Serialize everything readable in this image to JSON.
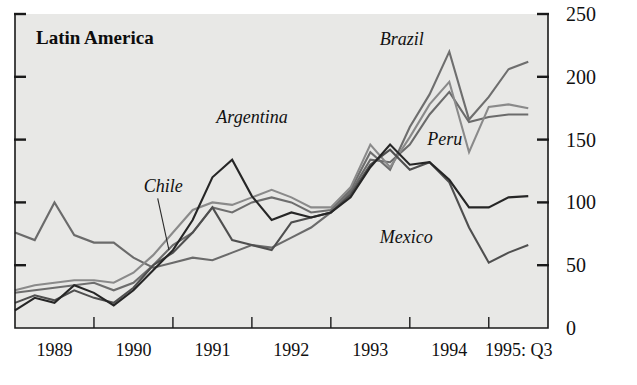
{
  "chart_data": {
    "type": "line",
    "title": "Latin America",
    "xlabel": "",
    "ylabel": "",
    "ylim": [
      0,
      250
    ],
    "yticks": [
      0,
      50,
      100,
      150,
      200,
      250
    ],
    "ytick_labels": [
      "0",
      "50",
      "100",
      "150",
      "200",
      "250"
    ],
    "grid": false,
    "legend_position": "inline-annotations",
    "xlim": [
      1989.0,
      1995.75
    ],
    "xtick_positions": [
      1989,
      1990,
      1991,
      1992,
      1993,
      1994,
      1995
    ],
    "xtick_labels": [
      "1989",
      "1990",
      "1991",
      "1992",
      "1993",
      "1994",
      "1995: Q3"
    ],
    "x_quarters": [
      1989.0,
      1989.25,
      1989.5,
      1989.75,
      1990.0,
      1990.25,
      1990.5,
      1990.75,
      1991.0,
      1991.25,
      1991.5,
      1991.75,
      1992.0,
      1992.25,
      1992.5,
      1992.75,
      1993.0,
      1993.25,
      1993.5,
      1993.75,
      1994.0,
      1994.25,
      1994.5,
      1994.75,
      1995.0,
      1995.25,
      1995.5
    ],
    "series": [
      {
        "name": "Argentina",
        "color": "#262626",
        "width": 2.3,
        "label_x": 1991.55,
        "label_y": 163,
        "values": [
          14,
          24,
          20,
          34,
          28,
          18,
          30,
          46,
          62,
          86,
          120,
          134,
          105,
          86,
          92,
          88,
          92,
          104,
          128,
          146,
          130,
          132,
          118,
          96,
          96,
          104,
          105
        ]
      },
      {
        "name": "Brazil",
        "color": "#6e6e6e",
        "width": 2.5,
        "label_x": 1993.62,
        "label_y": 225,
        "values": [
          28,
          30,
          32,
          34,
          36,
          30,
          36,
          50,
          66,
          76,
          96,
          92,
          100,
          104,
          100,
          92,
          94,
          110,
          140,
          126,
          160,
          186,
          220,
          166,
          184,
          206,
          212
        ]
      },
      {
        "name": "Peru",
        "color": "#8a8a8a",
        "width": 2.5,
        "label_x": 1994.22,
        "label_y": 146,
        "values": [
          30,
          34,
          36,
          38,
          38,
          36,
          44,
          58,
          76,
          94,
          100,
          98,
          104,
          110,
          104,
          96,
          96,
          112,
          146,
          128,
          152,
          178,
          196,
          140,
          176,
          178,
          175
        ]
      },
      {
        "name": "Mexico",
        "color": "#4f4f4f",
        "width": 2.4,
        "label_x": 1993.62,
        "label_y": 68,
        "values": [
          20,
          26,
          22,
          30,
          24,
          20,
          32,
          50,
          60,
          76,
          96,
          70,
          66,
          62,
          84,
          88,
          92,
          106,
          130,
          142,
          126,
          132,
          116,
          80,
          52,
          60,
          66
        ]
      },
      {
        "name": "Chile",
        "color": "#6b6b6b",
        "width": 2.4,
        "label_x": 1990.63,
        "label_y": 108,
        "values": [
          76,
          70,
          100,
          74,
          68,
          68,
          56,
          48,
          52,
          56,
          54,
          60,
          66,
          64,
          72,
          80,
          92,
          108,
          134,
          132,
          146,
          170,
          188,
          164,
          168,
          170,
          170
        ]
      }
    ],
    "annotations": [
      {
        "text": "Chile",
        "x": 1990.63,
        "y": 108,
        "leader_to_x": 1990.95,
        "leader_to_y": 62
      },
      {
        "text": "Argentina",
        "x": 1991.55,
        "y": 163,
        "leader_to_x": null,
        "leader_to_y": null
      },
      {
        "text": "Brazil",
        "x": 1993.62,
        "y": 225,
        "leader_to_x": null,
        "leader_to_y": null
      },
      {
        "text": "Peru",
        "x": 1994.22,
        "y": 146,
        "leader_to_x": null,
        "leader_to_y": null
      },
      {
        "text": "Mexico",
        "x": 1993.62,
        "y": 68,
        "leader_to_x": null,
        "leader_to_y": null
      }
    ]
  },
  "figure": {
    "background": "#e8e8e6",
    "page_background": "#ffffff",
    "axis_color": "#1a1a1a"
  }
}
